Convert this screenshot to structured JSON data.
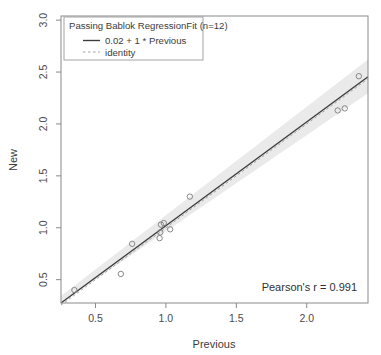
{
  "chart_data": {
    "type": "scatter",
    "title": "",
    "xlabel": "Previous",
    "ylabel": "New",
    "xlim": [
      0.255,
      2.435
    ],
    "ylim": [
      0.275,
      3.04
    ],
    "xticks": [
      0.5,
      1.0,
      1.5,
      2.0
    ],
    "xtick_labels": [
      "0.5",
      "1.0",
      "1.5",
      "2.0"
    ],
    "yticks": [
      0.5,
      1.0,
      1.5,
      2.0,
      2.5,
      3.0
    ],
    "ytick_labels": [
      "0.5",
      "1.0",
      "1.5",
      "2.0",
      "2.5",
      "3.0"
    ],
    "grid": false,
    "legend_position": "top-left",
    "points": [
      {
        "x": 0.35,
        "y": 0.4
      },
      {
        "x": 0.68,
        "y": 0.555
      },
      {
        "x": 0.76,
        "y": 0.845
      },
      {
        "x": 0.955,
        "y": 0.9
      },
      {
        "x": 0.96,
        "y": 0.955
      },
      {
        "x": 0.965,
        "y": 1.03
      },
      {
        "x": 0.985,
        "y": 1.045
      },
      {
        "x": 1.03,
        "y": 0.985
      },
      {
        "x": 1.17,
        "y": 1.3
      },
      {
        "x": 2.22,
        "y": 2.13
      },
      {
        "x": 2.27,
        "y": 2.15
      },
      {
        "x": 2.37,
        "y": 2.46
      }
    ],
    "series": [
      {
        "name": "0.02 + 1 * Previous",
        "type": "line",
        "style": "solid",
        "intercept": 0.02,
        "slope": 1
      },
      {
        "name": "identity",
        "type": "line",
        "style": "dashed",
        "intercept": 0,
        "slope": 1
      }
    ],
    "confidence_band": {
      "label": "confidence interval",
      "color": "#d8d8d8",
      "lower_intercept": -0.03,
      "lower_slope": 0.955,
      "upper_intercept": 0.075,
      "upper_slope": 1.045
    }
  },
  "legend": {
    "title": "Passing Bablok RegressionFit (n=12)",
    "entries": [
      {
        "label": "0.02 + 1 * Previous",
        "marker": "solid-line"
      },
      {
        "label": "identity",
        "marker": "dashed-line"
      }
    ]
  },
  "annotation": {
    "pearson": "Pearson's r = 0.991"
  },
  "colors": {
    "point_stroke": "#7d7d7d",
    "fit_line": "#3c3c3c",
    "identity_line": "#9a9a9a",
    "band": "#d8d8d8",
    "frame": "#8a8a8a",
    "background": "#ffffff"
  }
}
